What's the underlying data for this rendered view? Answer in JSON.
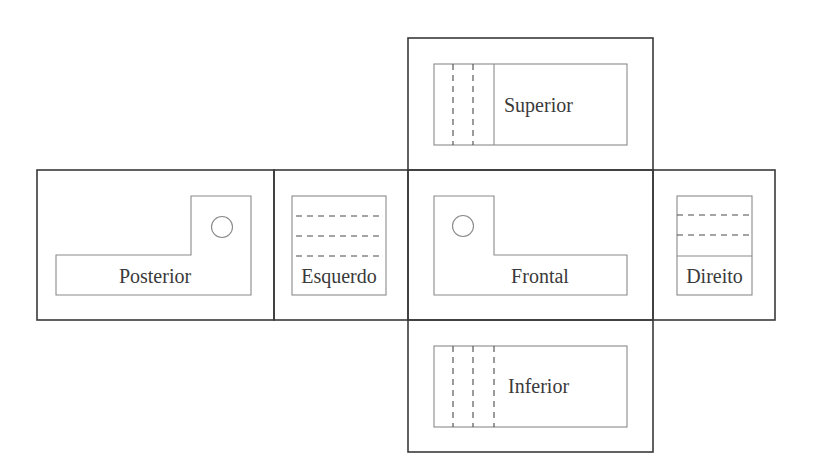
{
  "diagram": {
    "type": "orthographic-views-unfolded-box",
    "views": {
      "superior": {
        "label": "Superior"
      },
      "posterior": {
        "label": "Posterior"
      },
      "esquerdo": {
        "label": "Esquerdo"
      },
      "frontal": {
        "label": "Frontal"
      },
      "direito": {
        "label": "Direito"
      },
      "inferior": {
        "label": "Inferior"
      }
    },
    "colors": {
      "frame": "#3a3a3a",
      "part_outline": "#8a8a8a",
      "hidden_line": "#4a4a4a",
      "text": "#3a3a3a",
      "background": "#ffffff"
    }
  }
}
